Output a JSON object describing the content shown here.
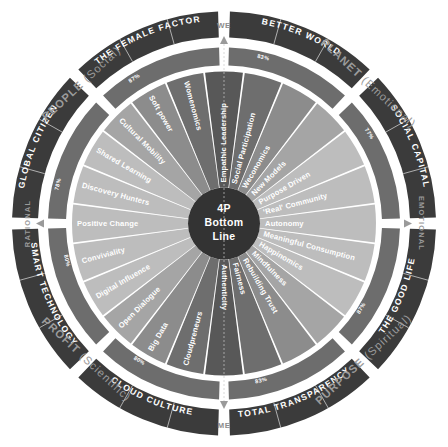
{
  "title": "4P Bottom Line",
  "center": {
    "line1": "4P",
    "line2": "Bottom",
    "line3": "Line"
  },
  "axes": {
    "top": "WE",
    "bottom": "ME",
    "left": "RATIONAL",
    "right": "EMOTIONAL"
  },
  "quadrants": [
    {
      "name": "PEOPLE",
      "qualifier": "(Social)"
    },
    {
      "name": "PLANET",
      "qualifier": "(Emotional)"
    },
    {
      "name": "PURPOSE",
      "qualifier": "(Spiritual)"
    },
    {
      "name": "PROFIT",
      "qualifier": "(Scientific)"
    }
  ],
  "colors": {
    "outer_dark": "#3b3b3b",
    "ring_mid_dark": "#585858",
    "ring_mid": "#6e6e6e",
    "ring_light": "#8c8c8c",
    "ring_lighter": "#a5a5a5",
    "ring_lightest": "#bdbdbd",
    "hub": "#333333",
    "background": "#ffffff",
    "muted_text": "#9b9b9b",
    "white_text": "#ffffff"
  },
  "segments": [
    {
      "id": "better-world",
      "outer_label": "BETTER WORLD",
      "percent": "83%",
      "quadrant": "PLANET",
      "spokes": [
        "Social Participation",
        "Weconomics",
        "New Models",
        "Purpose Driven"
      ]
    },
    {
      "id": "social-capital",
      "outer_label": "SOCIAL CAPITAL",
      "percent": "77%",
      "quadrant": "PLANET",
      "spokes": [
        "'Real' Community",
        "Autonomy",
        "Meaningful Consumption"
      ]
    },
    {
      "id": "the-good-life",
      "outer_label": "THE GOOD LIFE",
      "percent": "87%",
      "quadrant": "PURPOSE",
      "spokes": [
        "Happinomics",
        "Mindfulness",
        "Rebuilding Trust"
      ]
    },
    {
      "id": "total-transparency",
      "outer_label": "TOTAL TRANSPARENCY",
      "percent": "83%",
      "quadrant": "PURPOSE",
      "spokes": [
        "Fairness",
        "Authenticity"
      ]
    },
    {
      "id": "cloud-culture",
      "outer_label": "CLOUD CULTURE",
      "percent": "80%",
      "quadrant": "PROFIT",
      "spokes": [
        "Cloudpreneurs",
        "Big Data",
        "Open Dialogue"
      ]
    },
    {
      "id": "smart-technology",
      "outer_label": "SMART TECHNOLOGY",
      "percent": "80%",
      "quadrant": "PROFIT",
      "spokes": [
        "Digital Influence",
        "Conviviality",
        "Positive Change"
      ]
    },
    {
      "id": "global-citizen",
      "outer_label": "GLOBAL CITIZEN",
      "percent": "78%",
      "quadrant": "PEOPLE",
      "spokes": [
        "Discovery Hunters",
        "Shared Learning",
        "Cultural Mobility"
      ]
    },
    {
      "id": "the-female-factor",
      "outer_label": "THE FEMALE FACTOR",
      "percent": "87%",
      "quadrant": "PEOPLE",
      "spokes": [
        "Soft power",
        "Womenomics",
        "Empathic Leadership"
      ]
    }
  ],
  "spokes_clockwise_from_top": [
    "Empathic Leadership",
    "Social Participation",
    "Weconomics",
    "New Models",
    "Purpose Driven",
    "'Real' Community",
    "Autonomy",
    "Meaningful Consumption",
    "Happinomics",
    "Mindfulness",
    "Rebuilding Trust",
    "Fairness",
    "Authenticity",
    "Cloudpreneurs",
    "Big Data",
    "Open Dialogue",
    "Digital Influence",
    "Conviviality",
    "Positive Change",
    "Discovery Hunters",
    "Shared Learning",
    "Cultural Mobility",
    "Soft power",
    "Womenomics"
  ]
}
